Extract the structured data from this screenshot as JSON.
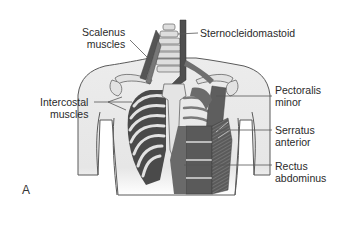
{
  "figure": {
    "panel_letter": "A",
    "style": "grayscale anatomical illustration",
    "colors": {
      "skin": "#e9e9e9",
      "outline": "#5a5a5a",
      "muscle_dark": "#4a4a4a",
      "muscle_mid": "#707070",
      "bone": "#dcdcdc",
      "leader_line": "#555555",
      "text": "#2a2a2a"
    }
  },
  "labels": {
    "scalenus": {
      "line1": "Scalenus",
      "line2": "muscles"
    },
    "sternocleidomastoid": {
      "line1": "Sternocleidomastoid"
    },
    "intercostal": {
      "line1": "Intercostal",
      "line2": "muscles"
    },
    "pectoralis_minor": {
      "line1": "Pectoralis",
      "line2": "minor"
    },
    "serratus_anterior": {
      "line1": "Serratus",
      "line2": "anterior"
    },
    "rectus_abdominus": {
      "line1": "Rectus",
      "line2": "abdominus"
    }
  }
}
